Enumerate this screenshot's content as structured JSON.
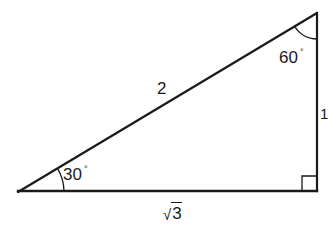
{
  "diagram": {
    "stroke_color": "#1a1a1a",
    "background_color": "#ffffff",
    "vertices": {
      "left": {
        "x": 18,
        "y": 192
      },
      "top_right": {
        "x": 317,
        "y": 13
      },
      "bottom_right": {
        "x": 317,
        "y": 191
      }
    },
    "angles": {
      "left": {
        "value": "30",
        "unit": "°"
      },
      "top": {
        "value": "60",
        "unit": "°"
      },
      "right_angle_marker": true
    },
    "sides": {
      "hypotenuse": "2",
      "vertical_leg": "1",
      "horizontal_leg_radical": "√",
      "horizontal_leg_value": "3"
    }
  }
}
